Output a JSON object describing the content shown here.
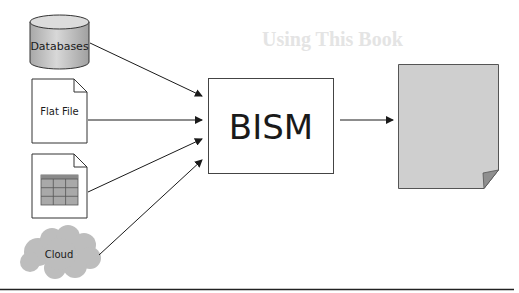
{
  "background_text": {
    "heading": "Using This Book"
  },
  "sources": [
    {
      "id": "databases",
      "label": "Databases",
      "shape": "cylinder"
    },
    {
      "id": "flat-file",
      "label": "Flat File",
      "shape": "document"
    },
    {
      "id": "spreadsheet",
      "label": "",
      "shape": "document-with-table"
    },
    {
      "id": "cloud",
      "label": "Cloud",
      "shape": "cloud"
    }
  ],
  "center": {
    "label": "BISM"
  },
  "output": {
    "label": "",
    "shape": "page-with-curl"
  },
  "colors": {
    "stroke": "#333333",
    "cylinder_fill": "#c8c8c8",
    "cloud_fill": "#bdbdbd",
    "output_fill": "#cfcfcf",
    "table_fill": "#a9a9a9",
    "rule": "#222222"
  }
}
